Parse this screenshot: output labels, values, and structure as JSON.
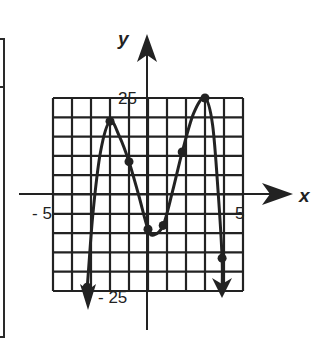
{
  "chart_data": {
    "type": "line",
    "title": "",
    "xlabel": "x",
    "ylabel": "y",
    "xlim": [
      -5,
      5
    ],
    "ylim": [
      -25,
      25
    ],
    "grid": true,
    "grid_step": {
      "x": 1,
      "y": 5
    },
    "tick_labels": {
      "x_min": "- 5",
      "x_max": "5",
      "y_max": "25",
      "y_min": "- 25"
    },
    "curve_points": [
      {
        "x": -3.3,
        "y": -26
      },
      {
        "x": -3.2,
        "y": -24
      },
      {
        "x": -2.9,
        "y": -5
      },
      {
        "x": -2.5,
        "y": 11
      },
      {
        "x": -2.0,
        "y": 19
      },
      {
        "x": -1.5,
        "y": 15
      },
      {
        "x": -1.0,
        "y": 8.5
      },
      {
        "x": -0.5,
        "y": 0
      },
      {
        "x": 0.0,
        "y": -9
      },
      {
        "x": 0.3,
        "y": -10.5
      },
      {
        "x": 0.8,
        "y": -8
      },
      {
        "x": 1.3,
        "y": 1
      },
      {
        "x": 1.8,
        "y": 11
      },
      {
        "x": 2.4,
        "y": 21
      },
      {
        "x": 3.0,
        "y": 25
      },
      {
        "x": 3.4,
        "y": 18
      },
      {
        "x": 3.7,
        "y": 0
      },
      {
        "x": 3.9,
        "y": -16.5
      },
      {
        "x": 3.9,
        "y": -25
      }
    ],
    "marked_points": [
      {
        "x": -3.2,
        "y": -24
      },
      {
        "x": -2.0,
        "y": 19
      },
      {
        "x": -1.0,
        "y": 8.5
      },
      {
        "x": 0.0,
        "y": -9
      },
      {
        "x": 0.8,
        "y": -8
      },
      {
        "x": 1.8,
        "y": 11
      },
      {
        "x": 3.0,
        "y": 25
      },
      {
        "x": 3.9,
        "y": -16.5
      }
    ],
    "end_behavior": {
      "left": "down",
      "right": "down"
    }
  },
  "colors": {
    "ink": "#222222",
    "background": "#ffffff"
  }
}
